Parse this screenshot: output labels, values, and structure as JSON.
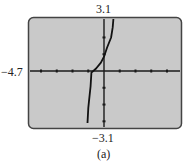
{
  "chart_data": {
    "type": "line",
    "title": "",
    "caption": "(a)",
    "window": {
      "xmin": -4.7,
      "xmax": 4.7,
      "ymin": -3.1,
      "ymax": 3.1
    },
    "labels": {
      "ymax": "3.1",
      "ymin": "−3.1",
      "xmin": "−4.7"
    },
    "xlabel": "",
    "ylabel": "",
    "grid": false,
    "x_ticks": [
      -4,
      -3,
      -2,
      -1,
      1,
      2,
      3,
      4
    ],
    "y_ticks": [
      -3,
      -2,
      -1,
      1,
      2
    ],
    "series": [
      {
        "name": "graph",
        "points": [
          [
            -1.05,
            -3.1
          ],
          [
            -1.0,
            -2.2
          ],
          [
            -0.95,
            -1.8
          ],
          [
            -0.85,
            -0.9
          ],
          [
            -0.8,
            -0.1
          ],
          [
            -0.5,
            0.15
          ],
          [
            -0.2,
            0.5
          ],
          [
            0,
            0.85
          ],
          [
            0.2,
            1.4
          ],
          [
            0.45,
            2.0
          ],
          [
            0.55,
            2.6
          ],
          [
            0.6,
            3.1
          ]
        ]
      }
    ],
    "colors": {
      "screen_bg": "#c9c9c9",
      "frame": "#444444",
      "axes": "#1a1a1a",
      "curve": "#111111"
    }
  }
}
